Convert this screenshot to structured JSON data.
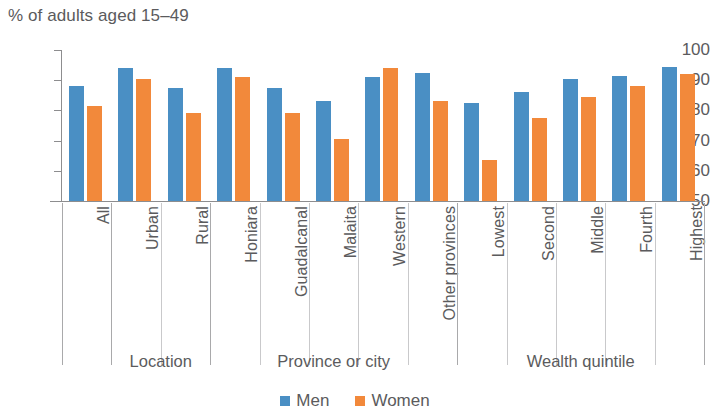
{
  "chart_data": {
    "type": "bar",
    "title": "% of adults aged 15–49",
    "xlabel": "",
    "ylabel": "% of adults aged 15–49",
    "ylim": [
      50,
      100
    ],
    "ytick_labels": [
      "100",
      "90",
      "80",
      "70",
      "60",
      "50"
    ],
    "ytick_values": [
      100,
      90,
      80,
      70,
      60,
      50
    ],
    "grid": false,
    "legend_position": "bottom-center",
    "categories": [
      "All",
      "Urban",
      "Rural",
      "Honiara",
      "Guadalcanal",
      "Malaita",
      "Western",
      "Other provinces",
      "Lowest",
      "Second",
      "Middle",
      "Fourth",
      "Highest"
    ],
    "series": [
      {
        "name": "Men",
        "color": "#4a8fc4",
        "values": [
          88,
          94,
          87.5,
          94,
          87.5,
          83,
          91,
          92.5,
          82.5,
          86,
          90.5,
          91.5,
          94.5
        ]
      },
      {
        "name": "Women",
        "color": "#f2893b",
        "values": [
          81.5,
          90.5,
          79,
          91,
          79,
          70.5,
          94,
          83,
          63.5,
          77.5,
          84.5,
          88,
          92
        ]
      }
    ],
    "groups": [
      {
        "label": "",
        "categories": [
          "All"
        ]
      },
      {
        "label": "Location",
        "categories": [
          "Urban",
          "Rural"
        ]
      },
      {
        "label": "Province or city",
        "categories": [
          "Honiara",
          "Guadalcanal",
          "Malaita",
          "Western",
          "Other provinces"
        ]
      },
      {
        "label": "Wealth quintile",
        "categories": [
          "Lowest",
          "Second",
          "Middle",
          "Fourth",
          "Highest"
        ]
      }
    ]
  },
  "legend": {
    "items": [
      {
        "label": "Men",
        "color": "#4a8fc4"
      },
      {
        "label": "Women",
        "color": "#f2893b"
      }
    ]
  },
  "section_labels": [
    "Location",
    "Province or city",
    "Wealth quintile"
  ]
}
